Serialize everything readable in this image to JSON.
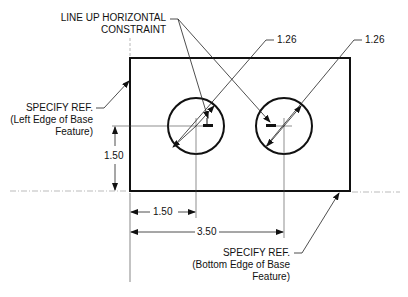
{
  "drawing": {
    "annotations": {
      "line_up_line1": "LINE UP HORIZONTAL",
      "line_up_line2": "CONSTRAINT",
      "diameter_left": "1.26",
      "diameter_right": "1.26",
      "specify_left_line1": "SPECIFY REF.",
      "specify_left_line2": "(Left Edge of Base",
      "specify_left_line3": "Feature)",
      "specify_bottom_line1": "SPECIFY REF.",
      "specify_bottom_line2": "(Bottom Edge of Base",
      "specify_bottom_line3": "Feature)"
    },
    "dimensions": {
      "vertical_hole_height": "1.50",
      "horizontal_hole1": "1.50",
      "horizontal_hole2": "3.50"
    },
    "colors": {
      "line": "#111111",
      "thin_line": "#333333",
      "dotted": "#999999"
    }
  }
}
